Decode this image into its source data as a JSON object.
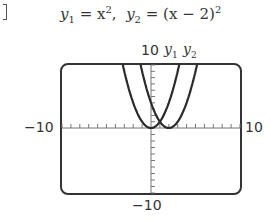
{
  "title": {
    "y1_name": "y",
    "y1_sub": "1",
    "y1_eq": " = x",
    "y1_exp": "2",
    "sep": ",  ",
    "y2_name": "y",
    "y2_sub": "2",
    "y2_eq": " = (x − 2)",
    "y2_exp": "2"
  },
  "window": {
    "ymax_label": "10",
    "ymin_label": "−10",
    "xmin_label": "−10",
    "xmax_label": "10",
    "series_labels": [
      "y1",
      "y2"
    ]
  },
  "chart_data": {
    "type": "line",
    "xlabel": "",
    "ylabel": "",
    "xlim": [
      -10,
      10
    ],
    "ylim": [
      -10,
      10
    ],
    "xticks_step": 1,
    "yticks_step": 1,
    "grid": false,
    "series": [
      {
        "name": "y1",
        "expression": "x^2",
        "x": [
          -3.16,
          -2,
          -1,
          0,
          1,
          2,
          3.16
        ],
        "values": [
          10,
          4,
          1,
          0,
          1,
          4,
          10
        ]
      },
      {
        "name": "y2",
        "expression": "(x-2)^2",
        "x": [
          -1.16,
          0,
          1,
          2,
          3,
          4,
          5.16
        ],
        "values": [
          10,
          4,
          1,
          0,
          1,
          4,
          10
        ]
      }
    ]
  }
}
